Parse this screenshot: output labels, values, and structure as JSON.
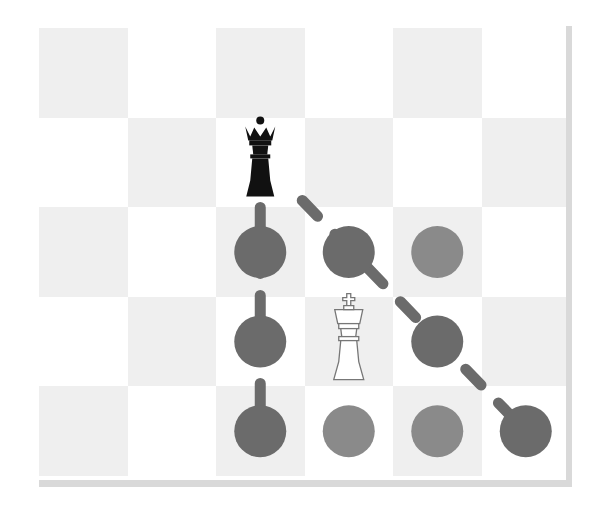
{
  "diagram": {
    "title": "",
    "board": {
      "cols": 6,
      "rows": 5,
      "origin": [
        39,
        28
      ],
      "cell_w": 88.5,
      "cell_h": 89.6,
      "colors": {
        "light_square": "#efefef",
        "white_square": "#ffffff",
        "border": "#d9d9d9"
      }
    },
    "pieces": [
      {
        "name": "black-queen",
        "glyph": "♛",
        "color": "#111111",
        "row": 1,
        "col": 2
      },
      {
        "name": "white-king",
        "glyph": "♔",
        "color": "#ffffff",
        "row": 3,
        "col": 3
      }
    ],
    "markers": {
      "attacked_color": "#6b6b6b",
      "safe_color": "#8a8a8a",
      "attacked": [
        {
          "row": 2,
          "col": 2,
          "line": "vertical"
        },
        {
          "row": 3,
          "col": 2,
          "line": "vertical"
        },
        {
          "row": 4,
          "col": 2,
          "line": "vertical"
        },
        {
          "row": 2,
          "col": 3,
          "line": "diagonal"
        },
        {
          "row": 3,
          "col": 4,
          "line": "diagonal"
        },
        {
          "row": 4,
          "col": 5,
          "line": "diagonal"
        }
      ],
      "safe": [
        {
          "row": 2,
          "col": 4
        },
        {
          "row": 4,
          "col": 3
        },
        {
          "row": 4,
          "col": 4
        }
      ]
    }
  }
}
